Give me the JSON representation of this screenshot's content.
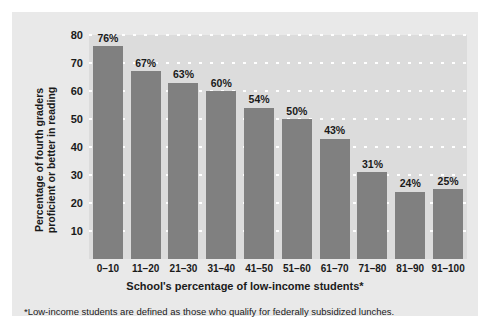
{
  "chart_data": {
    "type": "bar",
    "title": "",
    "categories": [
      "0–10",
      "11–20",
      "21–30",
      "31–40",
      "41–50",
      "51–60",
      "61–70",
      "71–80",
      "81–90",
      "91–100"
    ],
    "values": [
      76,
      67,
      63,
      60,
      54,
      50,
      43,
      31,
      24,
      25
    ],
    "value_labels": [
      "76%",
      "67%",
      "63%",
      "60%",
      "54%",
      "50%",
      "43%",
      "31%",
      "24%",
      "25%"
    ],
    "xlabel": "School's percentage of low-income students*",
    "ylabel_line1": "Percentage of fourth graders",
    "ylabel_line2": "proficient or better in reading",
    "ylim": [
      0,
      80
    ],
    "yticks": [
      10,
      20,
      30,
      40,
      50,
      60,
      70,
      80
    ],
    "ytick_labels": [
      "10",
      "20",
      "30",
      "40",
      "50",
      "60",
      "70",
      "80"
    ],
    "grid": true,
    "legend": "none",
    "bar_color": "#808080",
    "plot_background": "#dcdcdc",
    "figure_background": "#e9e9e9",
    "gridline_color": "#ffffff"
  },
  "footnote": "*Low-income students are defined as those who qualify for federally subsidized lunches."
}
